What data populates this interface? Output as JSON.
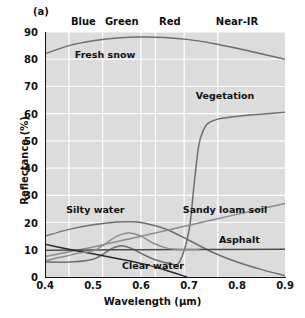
{
  "panel": {
    "label": "(a)"
  },
  "chart_data": {
    "type": "line",
    "title": "(a)",
    "xlabel": "Wavelength (µm)",
    "ylabel": "Reflectance (%)",
    "xlim": [
      0.4,
      0.9
    ],
    "ylim": [
      0,
      90
    ],
    "xticks": [
      "0.4",
      "0.5",
      "0.6",
      "0.7",
      "0.8",
      "0.9"
    ],
    "yticks": [
      "0",
      "10",
      "20",
      "30",
      "40",
      "50",
      "60",
      "70",
      "80",
      "90"
    ],
    "grid": true,
    "legend_position": "inline-annotations",
    "background": "#dcdcdc",
    "gridline_color": "#ffffff",
    "bands": [
      {
        "name": "Blue",
        "center": 0.48,
        "start": 0.45,
        "end": 0.52
      },
      {
        "name": "Green",
        "center": 0.56,
        "start": 0.52,
        "end": 0.6
      },
      {
        "name": "Red",
        "center": 0.66,
        "start": 0.63,
        "end": 0.69
      },
      {
        "name": "Near-IR",
        "center": 0.8,
        "start": 0.76,
        "end": 0.9
      }
    ],
    "band_boundaries": [
      0.45,
      0.52,
      0.6,
      0.63,
      0.69,
      0.76
    ],
    "series": [
      {
        "name": "Fresh snow",
        "color": "#6e6e6e",
        "label_x": 0.525,
        "label_y": 81.5,
        "x": [
          0.4,
          0.45,
          0.5,
          0.55,
          0.6,
          0.65,
          0.7,
          0.75,
          0.8,
          0.85,
          0.9
        ],
        "values": [
          82.0,
          85.0,
          86.8,
          87.8,
          88.2,
          88.0,
          87.2,
          85.8,
          84.0,
          82.0,
          80.0
        ]
      },
      {
        "name": "Vegetation",
        "color": "#6e6e6e",
        "label_x": 0.775,
        "label_y": 66.5,
        "x": [
          0.4,
          0.45,
          0.5,
          0.54,
          0.56,
          0.58,
          0.62,
          0.66,
          0.68,
          0.7,
          0.71,
          0.72,
          0.73,
          0.74,
          0.76,
          0.8,
          0.85,
          0.9
        ],
        "values": [
          5.5,
          5.5,
          6.5,
          10.5,
          11.5,
          10.5,
          7.0,
          5.0,
          5.5,
          17.0,
          33.0,
          48.0,
          54.0,
          56.5,
          58.0,
          59.0,
          59.8,
          60.5
        ]
      },
      {
        "name": "Silty water",
        "color": "#6e6e6e",
        "label_x": 0.505,
        "label_y": 24.5,
        "x": [
          0.4,
          0.45,
          0.5,
          0.55,
          0.58,
          0.6,
          0.63,
          0.66,
          0.7,
          0.75,
          0.8,
          0.85,
          0.9
        ],
        "values": [
          15.0,
          17.5,
          19.2,
          20.2,
          20.3,
          20.0,
          18.8,
          17.0,
          13.5,
          9.0,
          5.5,
          2.8,
          0.5
        ]
      },
      {
        "name": "Sandy loam soil",
        "color": "#8c8c8c",
        "label_x": 0.775,
        "label_y": 24.5,
        "x": [
          0.4,
          0.5,
          0.6,
          0.7,
          0.8,
          0.9
        ],
        "values": [
          7.5,
          11.0,
          15.0,
          19.0,
          23.0,
          27.0
        ]
      },
      {
        "name": "Asphalt",
        "color": "#4a4a4a",
        "label_x": 0.805,
        "label_y": 13.5,
        "x": [
          0.4,
          0.55,
          0.7,
          0.9
        ],
        "values": [
          9.8,
          10.0,
          10.1,
          10.2
        ]
      },
      {
        "name": "Clear water",
        "color": "#2b2b2b",
        "label_x": 0.625,
        "label_y": 4.2,
        "x": [
          0.4,
          0.45,
          0.5,
          0.55,
          0.6,
          0.65,
          0.695
        ],
        "values": [
          12.0,
          10.2,
          8.5,
          6.8,
          5.0,
          2.6,
          0.0
        ]
      },
      {
        "name": "Silty water lobe",
        "color": "#8c8c8c",
        "label_x": null,
        "label_y": null,
        "x": [
          0.4,
          0.44,
          0.47,
          0.5,
          0.52,
          0.55,
          0.575,
          0.6,
          0.625,
          0.65,
          0.67,
          0.7,
          0.72
        ],
        "values": [
          6.0,
          7.5,
          8.8,
          9.6,
          11.5,
          15.0,
          16.2,
          15.0,
          12.5,
          10.8,
          10.2,
          10.0,
          10.0
        ]
      }
    ]
  }
}
